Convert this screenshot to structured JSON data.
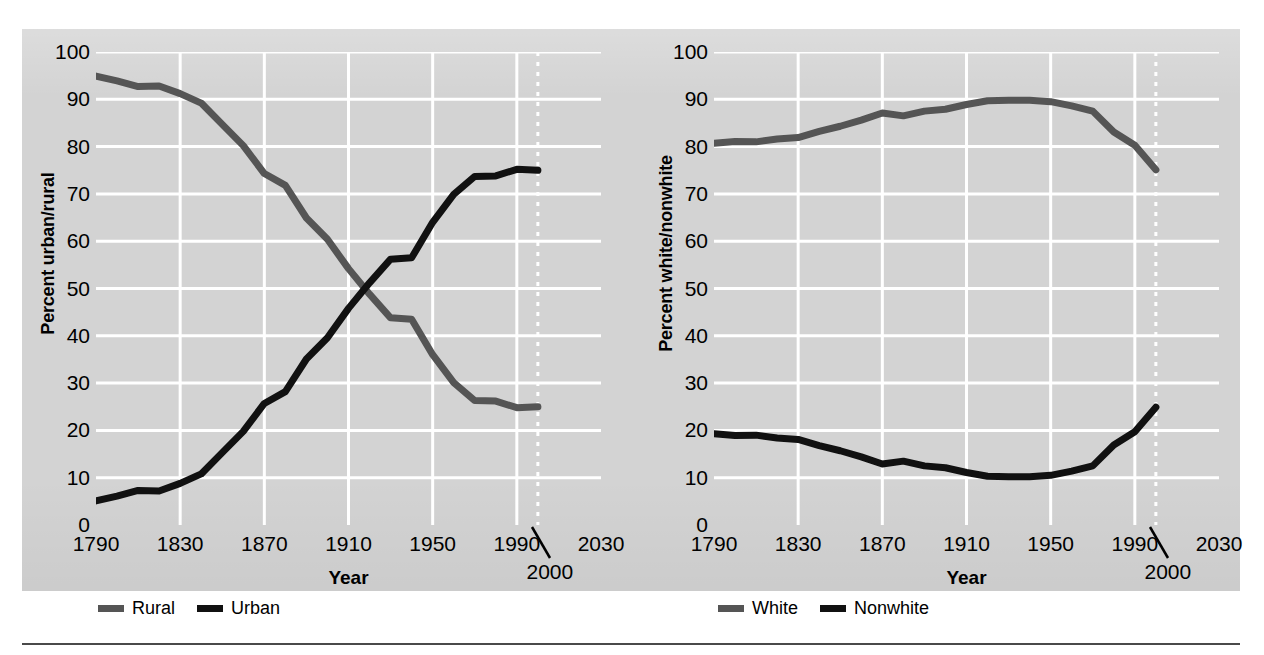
{
  "figure": {
    "background_color": "#ffffff",
    "panel_color": "#d3d3d3",
    "gridline_color": "#ffffff",
    "rule_color": "#4a4a4a"
  },
  "charts": [
    {
      "id": "urban-rural",
      "y_axis_title": "Percent urban/rural",
      "x_axis_title": "Year",
      "callout_label": "2000",
      "legend": [
        {
          "label": "Rural",
          "color": "#555555"
        },
        {
          "label": "Urban",
          "color": "#111111"
        }
      ]
    },
    {
      "id": "white-nonwhite",
      "y_axis_title": "Percent white/nonwhite",
      "x_axis_title": "Year",
      "callout_label": "2000",
      "legend": [
        {
          "label": "White",
          "color": "#555555"
        },
        {
          "label": "Nonwhite",
          "color": "#111111"
        }
      ]
    }
  ],
  "chart_data": [
    {
      "type": "line",
      "id": "urban-rural",
      "title": "",
      "xlabel": "Year",
      "ylabel": "Percent urban/rural",
      "xlim": [
        1790,
        2030
      ],
      "ylim": [
        0,
        100
      ],
      "xticks": [
        1790,
        1830,
        1870,
        1910,
        1950,
        1990,
        2030
      ],
      "yticks": [
        0,
        10,
        20,
        30,
        40,
        50,
        60,
        70,
        80,
        90,
        100
      ],
      "grid": true,
      "legend_position": "below",
      "annotations": [
        {
          "text": "2000",
          "x": 2000,
          "kind": "dotted-vertical-with-leader"
        }
      ],
      "x": [
        1790,
        1800,
        1810,
        1820,
        1830,
        1840,
        1850,
        1860,
        1870,
        1880,
        1890,
        1900,
        1910,
        1920,
        1930,
        1940,
        1950,
        1960,
        1970,
        1980,
        1990,
        2000
      ],
      "series": [
        {
          "name": "Rural",
          "color": "#555555",
          "values": [
            94.9,
            93.9,
            92.7,
            92.8,
            91.2,
            89.2,
            84.7,
            80.2,
            74.3,
            71.8,
            64.9,
            60.4,
            54.2,
            48.8,
            43.8,
            43.5,
            36.0,
            30.1,
            26.3,
            26.2,
            24.8,
            25.0
          ]
        },
        {
          "name": "Urban",
          "color": "#111111",
          "values": [
            5.1,
            6.1,
            7.3,
            7.2,
            8.8,
            10.8,
            15.3,
            19.8,
            25.7,
            28.2,
            35.1,
            39.6,
            45.8,
            51.2,
            56.2,
            56.5,
            64.0,
            69.9,
            73.7,
            73.8,
            75.2,
            75.0
          ]
        }
      ]
    },
    {
      "type": "line",
      "id": "white-nonwhite",
      "title": "",
      "xlabel": "Year",
      "ylabel": "Percent white/nonwhite",
      "xlim": [
        1790,
        2030
      ],
      "ylim": [
        0,
        100
      ],
      "xticks": [
        1790,
        1830,
        1870,
        1910,
        1950,
        1990,
        2030
      ],
      "yticks": [
        0,
        10,
        20,
        30,
        40,
        50,
        60,
        70,
        80,
        90,
        100
      ],
      "grid": true,
      "legend_position": "below",
      "annotations": [
        {
          "text": "2000",
          "x": 2000,
          "kind": "dotted-vertical-with-leader"
        }
      ],
      "x": [
        1790,
        1800,
        1810,
        1820,
        1830,
        1840,
        1850,
        1860,
        1870,
        1880,
        1890,
        1900,
        1910,
        1920,
        1930,
        1940,
        1950,
        1960,
        1970,
        1980,
        1990,
        2000
      ],
      "series": [
        {
          "name": "White",
          "color": "#555555",
          "values": [
            80.7,
            81.1,
            81.0,
            81.6,
            81.9,
            83.2,
            84.3,
            85.6,
            87.1,
            86.5,
            87.5,
            87.9,
            88.9,
            89.7,
            89.8,
            89.8,
            89.5,
            88.6,
            87.5,
            83.1,
            80.3,
            75.1
          ]
        },
        {
          "name": "Nonwhite",
          "color": "#111111",
          "values": [
            19.3,
            18.9,
            19.0,
            18.4,
            18.1,
            16.8,
            15.7,
            14.4,
            12.9,
            13.5,
            12.5,
            12.1,
            11.1,
            10.3,
            10.2,
            10.2,
            10.5,
            11.4,
            12.5,
            16.9,
            19.7,
            24.9
          ]
        }
      ]
    }
  ]
}
